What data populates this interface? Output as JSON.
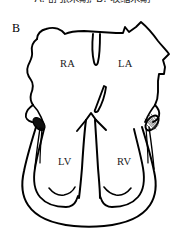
{
  "figure": {
    "caption": "A. 舒张末期; B. 收缩末期",
    "panel_letter": "B",
    "background_color": "#ffffff",
    "line_color": "#000000",
    "label_color": "#1a1a1a"
  },
  "labels": {
    "right_atrium": "RA",
    "left_atrium": "LA",
    "left_ventricle": "LV",
    "right_ventricle": "RV"
  }
}
